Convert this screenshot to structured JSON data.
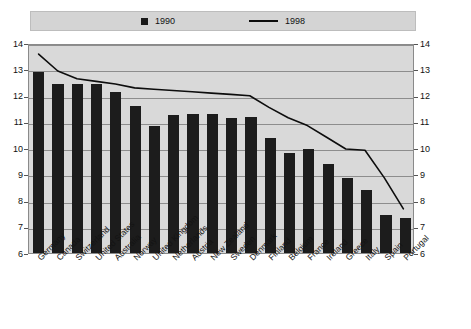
{
  "legend": {
    "items": [
      {
        "label": "1990",
        "marker": "square-marker",
        "color": "#1a1a1a"
      },
      {
        "label": "1998",
        "marker": "line-marker",
        "color": "#0d0d0d"
      }
    ]
  },
  "axis": {
    "y_ticks": [
      "6",
      "7",
      "8",
      "9",
      "10",
      "11",
      "12",
      "13",
      "14"
    ],
    "y_ticks_right": [
      "6",
      "7",
      "8",
      "9",
      "10",
      "11",
      "12",
      "13",
      "14"
    ]
  },
  "colors": {
    "bar": "#1c1c1c",
    "line": "#0d0d0d",
    "plot_background": "#d9d9d9",
    "legend_background": "#d4d4d4",
    "gridline": "#8d8d8d",
    "frame": "#8a8a8a"
  },
  "chart_data": {
    "type": "bar",
    "title": "",
    "subtitle": "",
    "xlabel": "",
    "ylabel": "",
    "ylim": [
      6,
      14
    ],
    "ytick_step": 1,
    "grid": true,
    "legend_position": "top",
    "categories": [
      "Germany",
      "Canada",
      "Switzerland",
      "United States",
      "Australia",
      "Norway",
      "United Kingdom",
      "Netherlands",
      "Austria",
      "New Zealand",
      "Sweden",
      "Denmark",
      "Finland",
      "Belgium",
      "France",
      "Ireland",
      "Greece",
      "Italy",
      "Spain",
      "Portugal"
    ],
    "series": [
      {
        "name": "1990",
        "type": "bar",
        "values": [
          12.9,
          12.45,
          12.45,
          12.45,
          12.15,
          11.6,
          10.85,
          11.25,
          11.3,
          11.3,
          11.15,
          11.2,
          10.4,
          9.8,
          9.95,
          9.4,
          8.85,
          8.4,
          7.45,
          7.35
        ]
      },
      {
        "name": "1998",
        "type": "line",
        "values": [
          13.65,
          13.0,
          12.7,
          12.6,
          12.5,
          12.35,
          12.3,
          12.25,
          12.2,
          12.15,
          12.1,
          12.05,
          11.6,
          11.2,
          10.9,
          10.45,
          10.0,
          9.95,
          8.9,
          7.7
        ]
      }
    ]
  }
}
